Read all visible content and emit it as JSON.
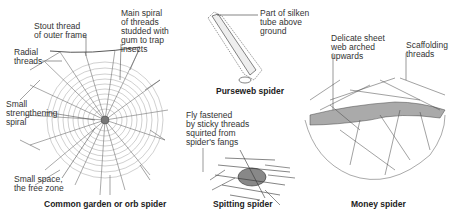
{
  "figures": {
    "orb": {
      "caption": "Common garden or orb spider",
      "labels": {
        "outer_frame": "Stout thread\nof outer frame",
        "main_spiral": "Main spiral\nof threads\nstudded with\ngum to trap\ninsects",
        "radial": "Radial\nthreads",
        "strengthening": "Small\nstrengthening\nspiral",
        "free_zone": "Small space,\nthe free zone"
      }
    },
    "purseweb": {
      "caption": "Purseweb spider",
      "labels": {
        "tube": "Part of silken\ntube above\nground"
      }
    },
    "spitting": {
      "caption": "Spitting spider",
      "labels": {
        "fly": "Fly fastened\nby sticky threads\nsquirted from\nspider's fangs"
      }
    },
    "money": {
      "caption": "Money spider",
      "labels": {
        "sheet": "Delicate sheet\nweb arched\nupwards",
        "scaffold": "Scaffolding\nthreads"
      }
    }
  }
}
